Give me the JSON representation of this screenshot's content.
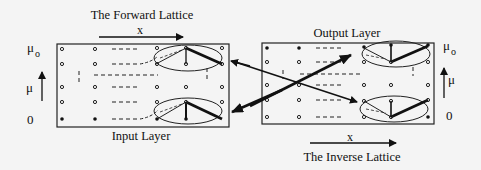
{
  "forward": {
    "title": "The Forward Lattice",
    "x_label": "x",
    "layer_label": "Input Layer",
    "mu_top": "μ",
    "mu_top_sub": "o",
    "mu_mid": "μ",
    "mu_bottom": "0"
  },
  "inverse": {
    "title": "The Inverse Lattice",
    "x_label": "x",
    "layer_label": "Output Layer",
    "mu_top": "μ",
    "mu_top_sub": "o",
    "mu_mid": "μ",
    "mu_bottom": "0"
  },
  "colors": {
    "ink": "#111111",
    "background": "#f4f4f4"
  }
}
